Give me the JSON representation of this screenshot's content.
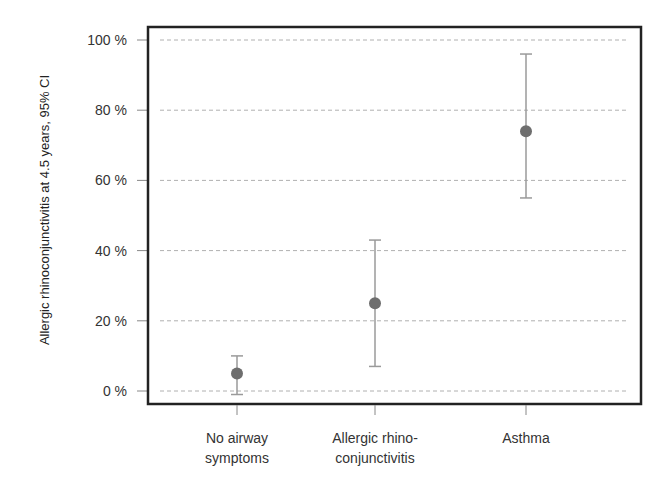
{
  "chart_data": {
    "type": "scatter",
    "subtype": "point-with-error-bars",
    "title": "",
    "xlabel": "",
    "ylabel": "Allergic rhinoconjunctivitis at 4.5 years, 95% CI",
    "categories": [
      [
        "No airway",
        "symptoms"
      ],
      [
        "Allergic rhino-",
        "conjunctivitis"
      ],
      [
        "Asthma"
      ]
    ],
    "category_names": [
      "No airway symptoms",
      "Allergic rhinoconjunctivitis",
      "Asthma"
    ],
    "values": [
      5,
      25,
      74
    ],
    "ci_lower": [
      -1,
      7,
      55
    ],
    "ci_upper": [
      10,
      43,
      96
    ],
    "ylim": [
      0,
      100
    ],
    "yticks": [
      0,
      20,
      40,
      60,
      80,
      100
    ],
    "ytick_labels": [
      "0 %",
      "20 %",
      "40 %",
      "60 %",
      "80 %",
      "100 %"
    ],
    "grid": true,
    "grid_style": "dashed horizontal",
    "legend": false
  },
  "colors": {
    "frame": "#222222",
    "grid": "#b0b0b0",
    "errorbar": "#9a9a9a",
    "point": "#6e6e6e",
    "text": "#333333"
  }
}
